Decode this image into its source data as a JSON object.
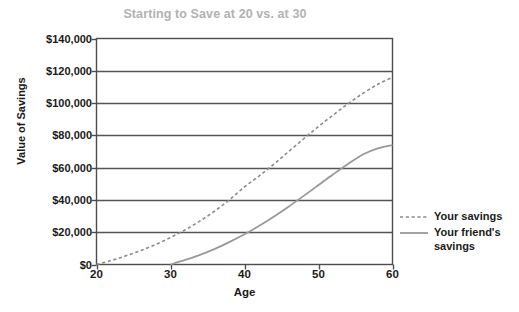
{
  "chart_data": {
    "type": "line",
    "title": "Starting to Save at 20 vs. at 30",
    "xlabel": "Age",
    "ylabel": "Value of Savings",
    "xlim": [
      20,
      60
    ],
    "ylim": [
      0,
      140000
    ],
    "xticks": [
      "20",
      "30",
      "40",
      "50",
      "60"
    ],
    "xtick_values": [
      20,
      30,
      40,
      50,
      60
    ],
    "yticks": [
      "$0",
      "$20,000",
      "$40,000",
      "$60,000",
      "$80,000",
      "$100,000",
      "$120,000",
      "$140,000"
    ],
    "ytick_values": [
      0,
      20000,
      40000,
      60000,
      80000,
      100000,
      120000,
      140000
    ],
    "grid": "horizontal",
    "legend_position": "right",
    "series": [
      {
        "name": "Your savings",
        "style": "dashed",
        "color": "#8c8c8c",
        "x": [
          20,
          22,
          24,
          26,
          28,
          30,
          32,
          34,
          36,
          38,
          40,
          42,
          44,
          46,
          48,
          50,
          52,
          54,
          56,
          58,
          60
        ],
        "values": [
          0,
          2500,
          5400,
          8700,
          12400,
          16700,
          21500,
          27000,
          33200,
          40200,
          48100,
          54900,
          62300,
          70100,
          77900,
          85500,
          92700,
          99600,
          106000,
          111600,
          116000
        ]
      },
      {
        "name": "Your friend's savings",
        "style": "solid",
        "color": "#999999",
        "x": [
          30,
          32,
          34,
          36,
          38,
          40,
          42,
          44,
          46,
          48,
          50,
          52,
          54,
          56,
          58,
          60
        ],
        "values": [
          0,
          2800,
          6000,
          9700,
          14000,
          18700,
          24000,
          29800,
          36000,
          42500,
          49200,
          55900,
          62300,
          68100,
          71900,
          74000
        ]
      }
    ]
  },
  "legend": {
    "entries": [
      {
        "label": "Your savings"
      },
      {
        "label": "Your friend's savings"
      }
    ]
  },
  "colors": {
    "title": "#b2b2b2",
    "axis": "#4d4d4d",
    "grid": "#555555",
    "series_dashed": "#8c8c8c",
    "series_solid": "#999999",
    "background": "#ffffff"
  }
}
